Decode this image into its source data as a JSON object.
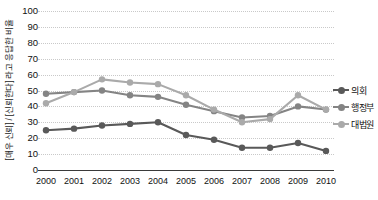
{
  "chart_data": {
    "type": "line",
    "title": "",
    "xlabel": "",
    "ylabel": "[매우 신뢰] / [신뢰한다] 라고 응답한 비율",
    "ylim": [
      0,
      100
    ],
    "ytick_step": 10,
    "grid": true,
    "legend_position": "right",
    "categories": [
      "2000",
      "2001",
      "2002",
      "2003",
      "2004",
      "2005",
      "2006",
      "2007",
      "2008",
      "2009",
      "2010"
    ],
    "series": [
      {
        "name": "의회",
        "color": "#595959",
        "values": [
          25,
          26,
          28,
          29,
          30,
          22,
          19,
          14,
          14,
          17,
          12
        ]
      },
      {
        "name": "행정부",
        "color": "#848484",
        "values": [
          48,
          49,
          50,
          47,
          46,
          41,
          37,
          33,
          34,
          40,
          38
        ]
      },
      {
        "name": "대법원",
        "color": "#aaaaaa",
        "values": [
          42,
          49,
          57,
          55,
          54,
          47,
          38,
          30,
          32,
          47,
          38
        ]
      }
    ],
    "yticks": [
      "0",
      "10",
      "20",
      "30",
      "40",
      "50",
      "60",
      "70",
      "80",
      "90",
      "100"
    ]
  },
  "axis": {
    "y_caption": "[매우 신뢰] / [신뢰한다] 라고 응답한 비율"
  },
  "legend": {
    "items": [
      {
        "label": "의회"
      },
      {
        "label": "행정부"
      },
      {
        "label": "대법원"
      }
    ]
  }
}
